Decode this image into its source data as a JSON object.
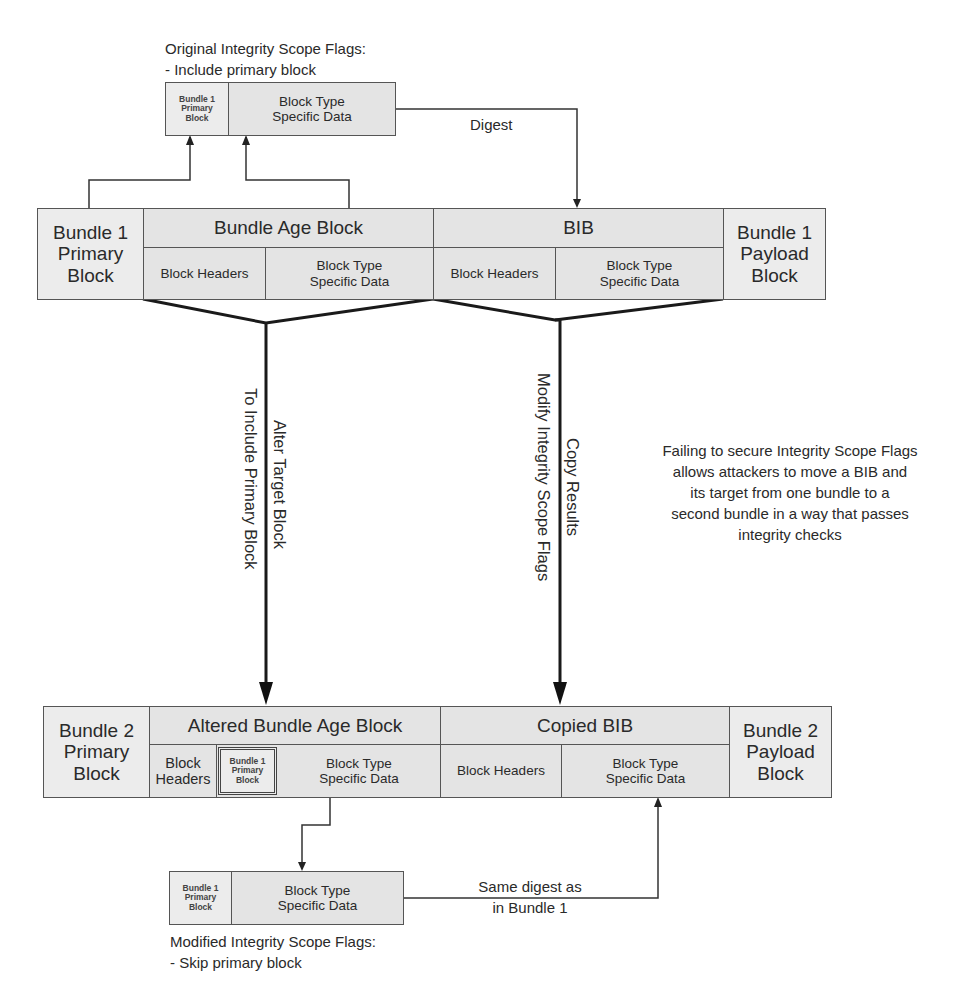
{
  "top_note": {
    "line1": "Original Integrity Scope Flags:",
    "line2": "- Include primary block"
  },
  "top_scope": {
    "primary": "Bundle 1 Primary Block",
    "data_line1": "Block Type",
    "data_line2": "Specific Data"
  },
  "digest_label": "Digest",
  "bundle1": {
    "primary_l1": "Bundle 1",
    "primary_l2": "Primary",
    "primary_l3": "Block",
    "age_block": "Bundle Age Block",
    "age_headers": "Block Headers",
    "age_data_l1": "Block Type",
    "age_data_l2": "Specific Data",
    "bib": "BIB",
    "bib_headers": "Block Headers",
    "bib_data_l1": "Block Type",
    "bib_data_l2": "Specific Data",
    "payload_l1": "Bundle 1",
    "payload_l2": "Payload",
    "payload_l3": "Block"
  },
  "left_arrow": {
    "label1": "Alter Target Block",
    "label2": "To Include Primary Block"
  },
  "right_arrow": {
    "label1": "Copy Results",
    "label2": "Modify Integrity Scope Flags"
  },
  "side_note": {
    "l1": "Failing to secure Integrity Scope Flags",
    "l2": "allows attackers to move a BIB and",
    "l3": "its target from one bundle to a",
    "l4": "second bundle in a way that passes",
    "l5": "integrity checks"
  },
  "bundle2": {
    "primary_l1": "Bundle 2",
    "primary_l2": "Primary",
    "primary_l3": "Block",
    "age_block": "Altered Bundle Age Block",
    "age_headers_l1": "Block",
    "age_headers_l2": "Headers",
    "embedded_l1": "Bundle 1",
    "embedded_l2": "Primary",
    "embedded_l3": "Block",
    "age_data_l1": "Block Type",
    "age_data_l2": "Specific Data",
    "bib": "Copied BIB",
    "bib_headers": "Block Headers",
    "bib_data_l1": "Block Type",
    "bib_data_l2": "Specific Data",
    "payload_l1": "Bundle 2",
    "payload_l2": "Payload",
    "payload_l3": "Block"
  },
  "bottom_scope": {
    "primary_l1": "Bundle 1",
    "primary_l2": "Primary",
    "primary_l3": "Block",
    "data_line1": "Block Type",
    "data_line2": "Specific Data"
  },
  "same_digest": {
    "l1": "Same digest as",
    "l2": "in Bundle 1"
  },
  "bottom_note": {
    "line1": "Modified Integrity Scope Flags:",
    "line2": "- Skip primary block"
  }
}
